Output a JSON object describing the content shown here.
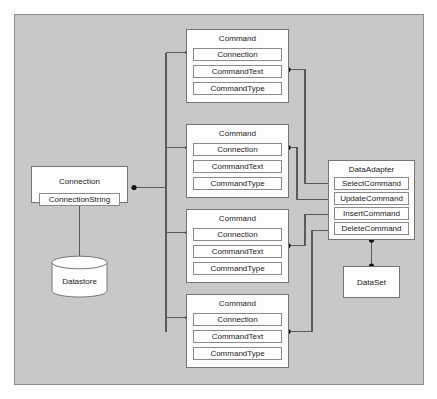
{
  "diagram": {
    "canvas_color": "#c8c8c8",
    "node_fill": "#fdfdfd",
    "line_color": "#5a5a5a",
    "border_color": "#767676"
  },
  "connection": {
    "title": "Connection",
    "attributes": [
      "ConnectionString"
    ]
  },
  "datastore": {
    "label": "Datastore"
  },
  "commands": [
    {
      "title": "Command",
      "attributes": [
        "Connection",
        "CommandText",
        "CommandType"
      ]
    },
    {
      "title": "Command",
      "attributes": [
        "Connection",
        "CommandText",
        "CommandType"
      ]
    },
    {
      "title": "Command",
      "attributes": [
        "Connection",
        "CommandText",
        "CommandType"
      ]
    },
    {
      "title": "Command",
      "attributes": [
        "Connection",
        "CommandText",
        "CommandType"
      ]
    }
  ],
  "data_adapter": {
    "title": "DataAdapter",
    "attributes": [
      "SelectCommand",
      "UpdateCommand",
      "InsertCommand",
      "DeleteCommand"
    ]
  },
  "data_set": {
    "label": "DataSet"
  }
}
